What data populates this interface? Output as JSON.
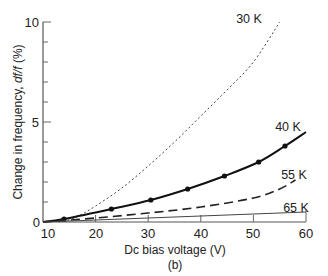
{
  "chart_data": {
    "type": "line",
    "title": "",
    "subtitle": "(b)",
    "xlabel": "Dc bias voltage (V)",
    "ylabel_parts": [
      "Change in frequency, ",
      "df/f",
      " (%)"
    ],
    "ylabel": "Change in frequency, df/f (%)",
    "xlim": [
      10,
      60
    ],
    "ylim": [
      0,
      10
    ],
    "x_ticks": [
      10,
      20,
      30,
      40,
      50,
      60
    ],
    "y_ticks_labeled": [
      0,
      5,
      10
    ],
    "y_minor_step": 1,
    "grid": false,
    "legend": "inline labels",
    "series": [
      {
        "name": "30 K",
        "style": "dotted",
        "markers": false,
        "x": [
          13,
          16,
          20,
          25,
          30,
          35,
          40,
          45,
          50,
          55
        ],
        "y": [
          0,
          0.2,
          0.8,
          1.7,
          2.8,
          4.0,
          5.3,
          6.6,
          8.0,
          10.0
        ]
      },
      {
        "name": "40 K",
        "style": "solid",
        "markers": true,
        "x": [
          10,
          14,
          23,
          30.5,
          37.5,
          44.5,
          51,
          56,
          60
        ],
        "y": [
          0,
          0.15,
          0.65,
          1.1,
          1.65,
          2.3,
          3.0,
          3.8,
          4.5
        ]
      },
      {
        "name": "55 K",
        "style": "dashed",
        "markers": false,
        "x": [
          10,
          20,
          30,
          40,
          50,
          55,
          58
        ],
        "y": [
          0,
          0.2,
          0.45,
          0.75,
          1.2,
          1.65,
          2.1
        ]
      },
      {
        "name": "65 K",
        "style": "solid-thin",
        "markers": false,
        "x": [
          10,
          60
        ],
        "y": [
          0,
          0.5
        ]
      }
    ]
  },
  "labels": {
    "x_title": "Dc bias voltage (V)",
    "caption": "(b)",
    "y_title_a": "Change in frequency, ",
    "y_title_b": "df/f",
    "y_title_c": " (%)",
    "s30": "30 K",
    "s40": "40 K",
    "s55": "55 K",
    "s65": "65 K",
    "xt0": "10",
    "xt1": "20",
    "xt2": "30",
    "xt3": "40",
    "xt4": "50",
    "xt5": "60",
    "yt0": "0",
    "yt5": "5",
    "yt10": "10"
  }
}
